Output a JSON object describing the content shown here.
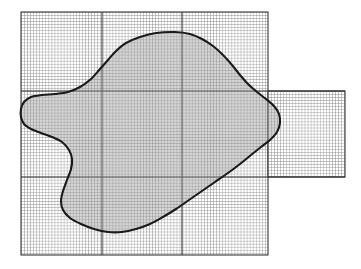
{
  "figure": {
    "type": "mesh-diagram",
    "width": 361,
    "height": 269,
    "background_color": "#ffffff"
  },
  "chart_data": {
    "type": "diagram",
    "grid": true,
    "legend": "none",
    "xlabel": "",
    "ylabel": "",
    "xlim": [
      21,
      345
    ],
    "ylim": [
      12,
      255
    ],
    "blocks": [
      {
        "name": "main-grid-block",
        "x": 21,
        "y": 12,
        "width": 247,
        "height": 243,
        "cell_size": 3.05,
        "minor_line_color": "#7a7a7a",
        "border_color": "#3a3a3a"
      },
      {
        "name": "right-extension-block",
        "x": 268,
        "y": 91,
        "width": 77,
        "height": 86,
        "cell_size": 3.05,
        "minor_line_color": "#7a7a7a",
        "border_color": "#3a3a3a"
      }
    ],
    "major_lines": {
      "vertical_x": [
        102,
        182
      ],
      "horizontal_y": [
        91,
        177
      ],
      "color": "#2b2b2b"
    },
    "region": {
      "name": "irregular-domain",
      "fill_color": "#9a9a9a",
      "fill_opacity": 0.42,
      "stroke_color": "#1a1a1a",
      "stroke_width": 2.1,
      "closed": true,
      "boundary_points": [
        [
          175,
          32
        ],
        [
          156,
          33
        ],
        [
          140,
          37
        ],
        [
          126,
          43
        ],
        [
          116,
          51
        ],
        [
          108,
          60
        ],
        [
          100,
          69
        ],
        [
          91,
          79
        ],
        [
          80,
          87
        ],
        [
          68,
          92
        ],
        [
          55,
          94
        ],
        [
          42,
          95
        ],
        [
          31,
          97
        ],
        [
          24,
          102
        ],
        [
          21,
          109
        ],
        [
          21,
          117
        ],
        [
          24,
          124
        ],
        [
          31,
          129
        ],
        [
          41,
          133
        ],
        [
          52,
          137
        ],
        [
          62,
          142
        ],
        [
          69,
          150
        ],
        [
          72,
          159
        ],
        [
          71,
          169
        ],
        [
          67,
          180
        ],
        [
          63,
          191
        ],
        [
          61,
          201
        ],
        [
          63,
          210
        ],
        [
          70,
          218
        ],
        [
          81,
          224
        ],
        [
          94,
          229
        ],
        [
          108,
          232
        ],
        [
          122,
          232
        ],
        [
          136,
          229
        ],
        [
          150,
          224
        ],
        [
          163,
          217
        ],
        [
          176,
          209
        ],
        [
          189,
          200
        ],
        [
          202,
          191
        ],
        [
          215,
          182
        ],
        [
          228,
          173
        ],
        [
          240,
          164
        ],
        [
          251,
          155
        ],
        [
          261,
          147
        ],
        [
          270,
          140
        ],
        [
          277,
          132
        ],
        [
          280,
          123
        ],
        [
          279,
          114
        ],
        [
          274,
          106
        ],
        [
          266,
          99
        ],
        [
          257,
          92
        ],
        [
          248,
          84
        ],
        [
          240,
          75
        ],
        [
          232,
          65
        ],
        [
          223,
          55
        ],
        [
          213,
          46
        ],
        [
          202,
          39
        ],
        [
          190,
          34
        ]
      ]
    }
  },
  "annotations": {
    "visible_labels": []
  }
}
